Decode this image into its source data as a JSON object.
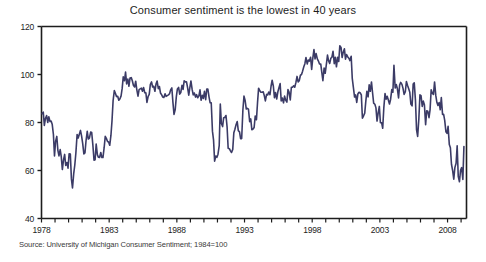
{
  "chart_data": {
    "type": "line",
    "title": "Consumer sentiment is the lowest in 40 years",
    "xlabel": "",
    "ylabel": "",
    "xlim": [
      1978.0,
      2009.4
    ],
    "ylim": [
      40,
      120
    ],
    "grid": false,
    "legend": null,
    "line_color": "#3b3b66",
    "axis_color": "#1d1d1d",
    "background": "#ffffff",
    "ytick_labels": [
      "40",
      "60",
      "80",
      "100",
      "120"
    ],
    "ytick_values": [
      40,
      60,
      80,
      100,
      120
    ],
    "xtick_labels": [
      "1978",
      "1983",
      "1988",
      "1993",
      "1998",
      "2003",
      "2008"
    ],
    "xtick_values": [
      1978,
      1983,
      1988,
      1993,
      1998,
      2003,
      2008
    ],
    "xtick_minor_step": 1,
    "source": "Source: University of Michigan Consumer Sentiment; 1984=100",
    "series": [
      {
        "name": "University of Michigan Consumer Sentiment",
        "x": [
          1978.04,
          1978.13,
          1978.21,
          1978.29,
          1978.38,
          1978.46,
          1978.54,
          1978.63,
          1978.71,
          1978.79,
          1978.88,
          1978.96,
          1979.04,
          1979.13,
          1979.21,
          1979.29,
          1979.38,
          1979.46,
          1979.54,
          1979.63,
          1979.71,
          1979.79,
          1979.88,
          1979.96,
          1980.04,
          1980.13,
          1980.21,
          1980.29,
          1980.38,
          1980.46,
          1980.54,
          1980.63,
          1980.71,
          1980.79,
          1980.88,
          1980.96,
          1981.04,
          1981.13,
          1981.21,
          1981.29,
          1981.38,
          1981.46,
          1981.54,
          1981.63,
          1981.71,
          1981.79,
          1981.88,
          1981.96,
          1982.04,
          1982.13,
          1982.21,
          1982.29,
          1982.38,
          1982.46,
          1982.54,
          1982.63,
          1982.71,
          1982.79,
          1982.88,
          1982.96,
          1983.04,
          1983.13,
          1983.21,
          1983.29,
          1983.38,
          1983.46,
          1983.54,
          1983.63,
          1983.71,
          1983.79,
          1983.88,
          1983.96,
          1984.04,
          1984.13,
          1984.21,
          1984.29,
          1984.38,
          1984.46,
          1984.54,
          1984.63,
          1984.71,
          1984.79,
          1984.88,
          1984.96,
          1985.04,
          1985.13,
          1985.21,
          1985.29,
          1985.38,
          1985.46,
          1985.54,
          1985.63,
          1985.71,
          1985.79,
          1985.88,
          1985.96,
          1986.04,
          1986.13,
          1986.21,
          1986.29,
          1986.38,
          1986.46,
          1986.54,
          1986.63,
          1986.71,
          1986.79,
          1986.88,
          1986.96,
          1987.04,
          1987.13,
          1987.21,
          1987.29,
          1987.38,
          1987.46,
          1987.54,
          1987.63,
          1987.71,
          1987.79,
          1987.88,
          1987.96,
          1988.04,
          1988.13,
          1988.21,
          1988.29,
          1988.38,
          1988.46,
          1988.54,
          1988.63,
          1988.71,
          1988.79,
          1988.88,
          1988.96,
          1989.04,
          1989.13,
          1989.21,
          1989.29,
          1989.38,
          1989.46,
          1989.54,
          1989.63,
          1989.71,
          1989.79,
          1989.88,
          1989.96,
          1990.04,
          1990.13,
          1990.21,
          1990.29,
          1990.38,
          1990.46,
          1990.54,
          1990.63,
          1990.71,
          1990.79,
          1990.88,
          1990.96,
          1991.04,
          1991.13,
          1991.21,
          1991.29,
          1991.38,
          1991.46,
          1991.54,
          1991.63,
          1991.71,
          1991.79,
          1991.88,
          1991.96,
          1992.04,
          1992.13,
          1992.21,
          1992.29,
          1992.38,
          1992.46,
          1992.54,
          1992.63,
          1992.71,
          1992.79,
          1992.88,
          1992.96,
          1993.04,
          1993.13,
          1993.21,
          1993.29,
          1993.38,
          1993.46,
          1993.54,
          1993.63,
          1993.71,
          1993.79,
          1993.88,
          1993.96,
          1994.04,
          1994.13,
          1994.21,
          1994.29,
          1994.38,
          1994.46,
          1994.54,
          1994.63,
          1994.71,
          1994.79,
          1994.88,
          1994.96,
          1995.04,
          1995.13,
          1995.21,
          1995.29,
          1995.38,
          1995.46,
          1995.54,
          1995.63,
          1995.71,
          1995.79,
          1995.88,
          1995.96,
          1996.04,
          1996.13,
          1996.21,
          1996.29,
          1996.38,
          1996.46,
          1996.54,
          1996.63,
          1996.71,
          1996.79,
          1996.88,
          1996.96,
          1997.04,
          1997.13,
          1997.21,
          1997.29,
          1997.38,
          1997.46,
          1997.54,
          1997.63,
          1997.71,
          1997.79,
          1997.88,
          1997.96,
          1998.04,
          1998.13,
          1998.21,
          1998.29,
          1998.38,
          1998.46,
          1998.54,
          1998.63,
          1998.71,
          1998.79,
          1998.88,
          1998.96,
          1999.04,
          1999.13,
          1999.21,
          1999.29,
          1999.38,
          1999.46,
          1999.54,
          1999.63,
          1999.71,
          1999.79,
          1999.88,
          1999.96,
          2000.04,
          2000.13,
          2000.21,
          2000.29,
          2000.38,
          2000.46,
          2000.54,
          2000.63,
          2000.71,
          2000.79,
          2000.88,
          2000.96,
          2001.04,
          2001.13,
          2001.21,
          2001.29,
          2001.38,
          2001.46,
          2001.54,
          2001.63,
          2001.71,
          2001.79,
          2001.88,
          2001.96,
          2002.04,
          2002.13,
          2002.21,
          2002.29,
          2002.38,
          2002.46,
          2002.54,
          2002.63,
          2002.71,
          2002.79,
          2002.88,
          2002.96,
          2003.04,
          2003.13,
          2003.21,
          2003.29,
          2003.38,
          2003.46,
          2003.54,
          2003.63,
          2003.71,
          2003.79,
          2003.88,
          2003.96,
          2004.04,
          2004.13,
          2004.21,
          2004.29,
          2004.38,
          2004.46,
          2004.54,
          2004.63,
          2004.71,
          2004.79,
          2004.88,
          2004.96,
          2005.04,
          2005.13,
          2005.21,
          2005.29,
          2005.38,
          2005.46,
          2005.54,
          2005.63,
          2005.71,
          2005.79,
          2005.88,
          2005.96,
          2006.04,
          2006.13,
          2006.21,
          2006.29,
          2006.38,
          2006.46,
          2006.54,
          2006.63,
          2006.71,
          2006.79,
          2006.88,
          2006.96,
          2007.04,
          2007.13,
          2007.21,
          2007.29,
          2007.38,
          2007.46,
          2007.54,
          2007.63,
          2007.71,
          2007.79,
          2007.88,
          2007.96,
          2008.04,
          2008.13,
          2008.21,
          2008.29,
          2008.38,
          2008.46,
          2008.54,
          2008.63,
          2008.71,
          2008.79,
          2008.88,
          2008.96,
          2009.04,
          2009.13,
          2009.21
        ],
        "y": [
          83.7,
          84.3,
          78.8,
          81.6,
          82.9,
          80.0,
          82.4,
          80.4,
          80.6,
          79.3,
          75.0,
          66.1,
          72.1,
          74.2,
          68.4,
          66.1,
          68.7,
          65.8,
          60.4,
          64.5,
          66.7,
          62.1,
          63.3,
          61.0,
          67.0,
          66.9,
          56.5,
          52.7,
          58.7,
          62.3,
          67.3,
          75.0,
          73.5,
          75.0,
          76.7,
          74.4,
          71.4,
          66.9,
          67.3,
          72.4,
          76.3,
          73.1,
          73.5,
          76.0,
          75.8,
          71.0,
          64.3,
          64.5,
          71.0,
          66.5,
          65.5,
          65.4,
          67.5,
          65.4,
          65.4,
          69.6,
          74.2,
          73.4,
          72.1,
          71.9,
          70.5,
          74.6,
          80.8,
          89.1,
          93.3,
          92.2,
          90.8,
          90.9,
          89.3,
          89.8,
          91.1,
          94.2,
          99.0,
          97.4,
          101.0,
          96.1,
          98.1,
          95.1,
          98.5,
          98.7,
          97.4,
          95.5,
          94.8,
          97.2,
          93.7,
          91.0,
          93.7,
          94.0,
          94.3,
          93.0,
          94.6,
          92.4,
          92.4,
          88.4,
          90.9,
          91.7,
          95.8,
          96.9,
          94.8,
          95.1,
          93.0,
          96.0,
          97.3,
          94.1,
          95.0,
          92.3,
          91.5,
          90.6,
          90.4,
          92.0,
          90.9,
          91.2,
          91.5,
          92.0,
          93.6,
          94.4,
          88.4,
          83.4,
          85.4,
          90.7,
          94.0,
          94.6,
          91.8,
          92.5,
          95.5,
          93.8,
          97.4,
          96.9,
          97.0,
          94.6,
          91.4,
          94.5,
          97.3,
          93.8,
          91.5,
          92.3,
          90.6,
          91.6,
          90.3,
          91.1,
          93.6,
          89.3,
          91.3,
          90.0,
          93.0,
          89.5,
          93.9,
          93.9,
          90.6,
          88.2,
          88.2,
          76.4,
          72.8,
          63.9,
          66.0,
          65.5,
          66.8,
          70.4,
          87.7,
          79.6,
          78.3,
          82.0,
          82.1,
          82.9,
          78.3,
          69.3,
          69.1,
          68.2,
          67.5,
          68.8,
          75.7,
          77.2,
          79.2,
          80.4,
          76.6,
          76.1,
          73.3,
          73.3,
          85.3,
          91.0,
          89.3,
          85.6,
          85.9,
          85.6,
          80.3,
          81.5,
          77.0,
          77.3,
          77.9,
          82.7,
          81.2,
          88.2,
          94.3,
          93.2,
          92.6,
          92.6,
          92.8,
          91.2,
          89.0,
          91.7,
          91.5,
          92.7,
          91.6,
          95.1,
          97.6,
          95.1,
          90.3,
          92.5,
          89.8,
          92.7,
          94.4,
          96.2,
          89.0,
          90.2,
          88.2,
          91.0,
          89.3,
          88.5,
          93.7,
          92.7,
          89.4,
          94.7,
          94.7,
          95.3,
          94.7,
          96.5,
          99.2,
          96.9,
          97.4,
          99.7,
          100.0,
          101.4,
          103.2,
          104.5,
          107.1,
          104.4,
          106.0,
          105.6,
          107.2,
          102.1,
          106.6,
          110.4,
          106.5,
          108.7,
          106.5,
          105.6,
          104.4,
          104.4,
          100.9,
          97.4,
          102.7,
          100.5,
          103.9,
          108.1,
          105.7,
          104.6,
          106.8,
          107.3,
          109.7,
          104.5,
          107.2,
          103.2,
          107.2,
          105.4,
          112.0,
          111.3,
          107.1,
          109.2,
          110.7,
          106.4,
          108.3,
          107.3,
          106.8,
          105.8,
          107.6,
          98.4,
          94.7,
          90.6,
          91.5,
          88.4,
          92.0,
          92.6,
          92.4,
          91.5,
          81.8,
          82.7,
          83.9,
          88.8,
          93.0,
          90.7,
          95.7,
          93.0,
          96.9,
          92.4,
          88.1,
          87.6,
          86.1,
          80.6,
          84.2,
          86.7,
          79.9,
          79.9,
          77.6,
          86.0,
          92.1,
          89.7,
          90.9,
          89.3,
          87.7,
          89.6,
          93.7,
          92.6,
          103.8,
          94.4,
          95.8,
          94.2,
          90.2,
          95.6,
          96.7,
          95.9,
          94.2,
          91.7,
          92.8,
          97.1,
          95.5,
          94.1,
          92.6,
          87.7,
          86.9,
          96.0,
          96.5,
          89.1,
          76.9,
          74.2,
          81.6,
          91.5,
          91.2,
          86.7,
          88.9,
          87.4,
          79.1,
          84.9,
          84.7,
          82.0,
          85.4,
          93.6,
          92.1,
          91.7,
          96.9,
          91.3,
          88.4,
          87.1,
          88.3,
          85.3,
          90.4,
          83.4,
          83.4,
          80.9,
          76.1,
          75.5,
          78.4,
          70.8,
          69.5,
          62.6,
          59.8,
          56.4,
          61.2,
          63.0,
          70.3,
          57.6,
          55.3,
          60.1,
          61.2,
          56.3,
          70.0
        ]
      }
    ]
  },
  "figure": {
    "title": "Consumer sentiment is the lowest in 40 years",
    "source": "Source: University of Michigan Consumer Sentiment; 1984=100"
  }
}
